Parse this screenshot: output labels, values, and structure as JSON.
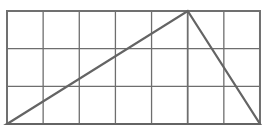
{
  "diagram": {
    "grid": {
      "columns": 7,
      "rows": 3,
      "origin_px": [
        7,
        11
      ],
      "cell_w_px": 36.14,
      "cell_h_px": 37.67,
      "line_color": "#6e6e6e",
      "border_color": "#707070"
    },
    "triangle": {
      "vertices_grid": [
        [
          0,
          3
        ],
        [
          5,
          0
        ],
        [
          7,
          3
        ]
      ],
      "stroke_color": "#646464"
    }
  }
}
